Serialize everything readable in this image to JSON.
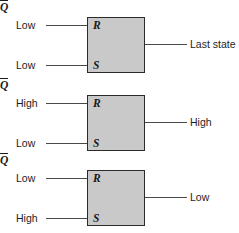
{
  "diagram": {
    "colors": {
      "box_fill": "#c9c9c9",
      "box_border": "#2b2b2b",
      "wire": "#4a4a4a",
      "text": "#1d1d1d",
      "background": "#ffffff"
    },
    "pin_names": {
      "reset": "R",
      "set": "S",
      "output": "Q"
    },
    "blocks": [
      {
        "id": "latch-state-1",
        "input_r_label": "Low",
        "input_s_label": "Low",
        "output_label": "Last state"
      },
      {
        "id": "latch-state-2",
        "input_r_label": "High",
        "input_s_label": "Low",
        "output_label": "High"
      },
      {
        "id": "latch-state-3",
        "input_r_label": "Low",
        "input_s_label": "High",
        "output_label": "Low"
      }
    ]
  }
}
